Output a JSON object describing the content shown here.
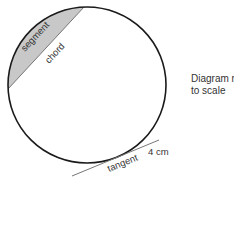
{
  "diagram": {
    "labels": {
      "segment": "segment",
      "chord": "chord",
      "tangent": "tangent",
      "length": "4 cm"
    },
    "note_line1": "Diagram not",
    "note_line2": "to scale",
    "colors": {
      "circle_stroke": "#1a1a1a",
      "segment_fill": "#c8c8c8",
      "chord_stroke": "#777777",
      "tangent_stroke": "#777777",
      "text": "#333333"
    }
  }
}
